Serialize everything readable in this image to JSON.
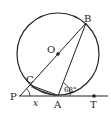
{
  "diagram": {
    "type": "geometry",
    "points": {
      "O": "O",
      "B": "B",
      "C": "C",
      "P": "P",
      "A": "A",
      "T": "T"
    },
    "angle_at_A": "68°",
    "angle_at_P": "x",
    "colors": {
      "stroke": "#222222",
      "background": "#ffffff"
    }
  }
}
